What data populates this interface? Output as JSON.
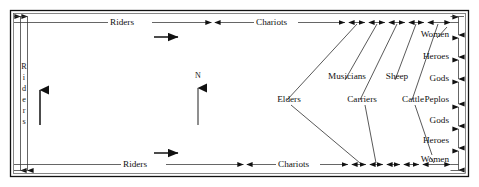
{
  "diagram": {
    "background_color": "#ffffff",
    "line_color": "#111111",
    "width": 479,
    "height": 187
  },
  "compass": {
    "label": "N",
    "direction": "up"
  },
  "west_side": {
    "label": "Riders",
    "letters": [
      "R",
      "i",
      "d",
      "e",
      "r",
      "s"
    ],
    "orientation": "vertical"
  },
  "north_side": {
    "segments": [
      {
        "label": "Riders"
      },
      {
        "label": "Chariots"
      },
      {
        "label": "Elders"
      },
      {
        "label": "Musicians"
      },
      {
        "label": "Carriers"
      },
      {
        "label": "Sheep"
      },
      {
        "label": "Cattle"
      }
    ]
  },
  "south_side": {
    "segments": [
      {
        "label": "Riders"
      },
      {
        "label": "Chariots"
      },
      {
        "label": "Elders"
      },
      {
        "label": "Musicians"
      },
      {
        "label": "Carriers"
      },
      {
        "label": "Sheep"
      },
      {
        "label": "Cattle"
      }
    ]
  },
  "east_side": {
    "segments": [
      {
        "label": "Women"
      },
      {
        "label": "Heroes"
      },
      {
        "label": "Gods"
      },
      {
        "label": "Peplos"
      },
      {
        "label": "Gods"
      },
      {
        "label": "Heroes"
      },
      {
        "label": "Women"
      }
    ]
  },
  "direction_arrows": {
    "north_flow": "eastward",
    "south_flow": "eastward",
    "west_flow": "northward"
  }
}
